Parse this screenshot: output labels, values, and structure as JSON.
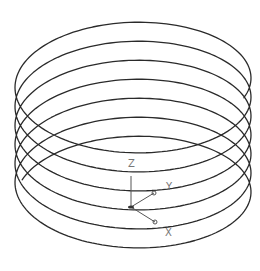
{
  "viewport": {
    "width": 260,
    "height": 271,
    "background": "#ffffff"
  },
  "helix": {
    "name": "helix",
    "stroke_color": "#2a2a2a",
    "stroke_width": 1.3,
    "center_x": 133,
    "radius_x": 118,
    "radius_y": 60.5,
    "bottom_center_y": 200.5,
    "pitch": 19,
    "start_angle_deg": 200,
    "end_angle_deg": 2540
  },
  "ucs_icon": {
    "color": "#555555",
    "origin": [
      131,
      207
    ],
    "axes": [
      {
        "name": "Z",
        "label": "Z",
        "end": [
          131,
          176
        ],
        "label_pos": [
          128,
          167
        ],
        "marker": false
      },
      {
        "name": "Y",
        "label": "Y",
        "end": [
          154,
          193
        ],
        "label_pos": [
          166,
          190
        ],
        "marker": true
      },
      {
        "name": "X",
        "label": "X",
        "end": [
          155,
          222
        ],
        "label_pos": [
          165,
          236
        ],
        "marker": true
      }
    ]
  }
}
